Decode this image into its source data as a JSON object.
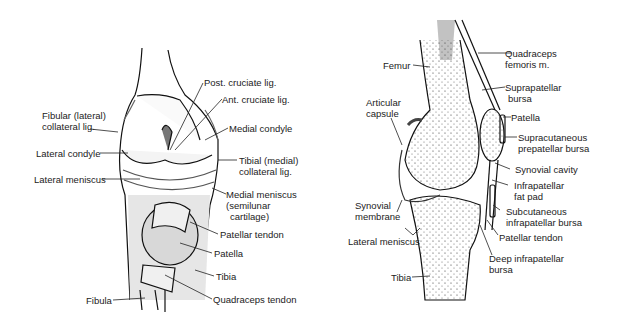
{
  "left_figure": {
    "title": "Anterior view of knee",
    "labels": {
      "post_cruciate": "Post. cruciate lig.",
      "ant_cruciate": "Ant. cruciate lig.",
      "fibular_collateral_1": "Fibular (lateral)",
      "fibular_collateral_2": "collateral lig.",
      "medial_condyle": "Medial condyle",
      "lateral_condyle": "Lateral condyle",
      "tibial_collateral_1": "Tibial (medial)",
      "tibial_collateral_2": "collateral lig.",
      "lateral_meniscus": "Lateral meniscus",
      "medial_meniscus_1": "Medial meniscus",
      "medial_meniscus_2": "(semilunar",
      "medial_meniscus_3": "cartilage)",
      "patellar_tendon": "Patellar tendon",
      "patella": "Patella",
      "tibia": "Tibia",
      "fibula": "Fibula",
      "quadriceps_tendon": "Quadraceps tendon"
    }
  },
  "right_figure": {
    "title": "Sagittal section of knee",
    "labels": {
      "quadriceps_1": "Quadraceps",
      "quadriceps_2": "femoris m.",
      "femur": "Femur",
      "suprapatellar_1": "Suprapatellar",
      "suprapatellar_2": "bursa",
      "articular_1": "Articular",
      "articular_2": "capsule",
      "patella": "Patella",
      "supracutaneous_1": "Supracutaneous",
      "supracutaneous_2": "prepatellar bursa",
      "synovial_cavity": "Synovial cavity",
      "infrapatellar_fat_1": "Infrapatellar",
      "infrapatellar_fat_2": "fat pad",
      "synovial_membrane_1": "Synovial",
      "synovial_membrane_2": "membrane",
      "subcutaneous_1": "Subcutaneous",
      "subcutaneous_2": "infrapatellar bursa",
      "lateral_meniscus": "Lateral meniscus",
      "patellar_tendon": "Patellar tendon",
      "deep_infrapatellar_1": "Deep infrapatellar",
      "deep_infrapatellar_2": "bursa",
      "tibia": "Tibia"
    }
  }
}
